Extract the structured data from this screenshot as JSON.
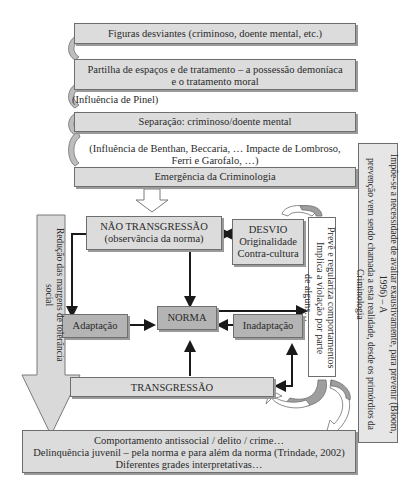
{
  "timeline": {
    "figuras": "Figuras desviantes (criminoso, doente mental, etc.)",
    "partilha_line1": "Partilha de espaços e de tratamento – a possessão demoníaca",
    "partilha_line2": "e o tratamento moral",
    "pinel": "(Influência de Pinel)",
    "separacao": "Separação: criminoso/doente mental",
    "benthan_line1": "(Influência de Benthan, Beccaria, … Impacte de Lombroso,",
    "benthan_line2": "Ferri e Garofalo, …)",
    "emergencia": "Emergência da Criminologia"
  },
  "core": {
    "nao_transgressao_line1": "NÃO TRANSGRESSÃO",
    "nao_transgressao_line2": "(observância da norma)",
    "desvio_line1": "DESVIO",
    "desvio_line2": "Originalidade",
    "desvio_line3": "Contra-cultura",
    "adaptacao": "Adaptação",
    "norma": "NORMA",
    "inadaptacao": "Inadaptação",
    "transgressao": "TRANSGRESSÃO"
  },
  "side_notes": {
    "preve_line1": "Prevê e regulariza comportamentos",
    "preve_line2": "Implica a violação por parte",
    "preve_line3": "de alguns…",
    "impoe_line1": "Impõe-se a necessidade de avaliar exaustivamente, para prevenir (Bloom, 1996) – A",
    "impoe_line2": "prevenção vem sendo chamada a esta realidade, desde os primórdios da Criminologia",
    "reducao": "Redução das margens de tolerância social"
  },
  "outcome": {
    "line1": "Comportamento antissocial / delito / crime…",
    "line2": "Delinquência juvenil – pela norma e para além da norma (Trindade, 2002)",
    "line3": "Diferentes grades interpretativas…"
  },
  "colors": {
    "box_light": "#dcdcdc",
    "box_dark": "#b4b4b4",
    "border": "#6e6e6e",
    "arrow": "#1a1a1a"
  }
}
